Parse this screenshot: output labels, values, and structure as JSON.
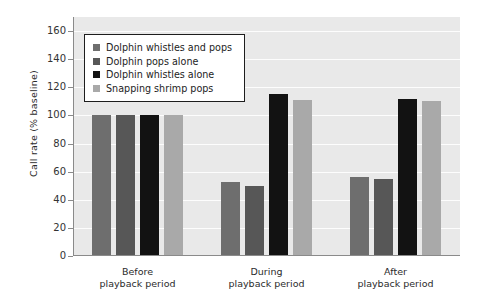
{
  "chart_data": {
    "type": "bar",
    "title": "",
    "xlabel": "",
    "ylabel": "Call rate (% baseline)",
    "ylim": [
      0,
      170
    ],
    "ytick_values": [
      0,
      20,
      40,
      60,
      80,
      100,
      120,
      140,
      160
    ],
    "ytick_labels": [
      "0",
      "20",
      "40",
      "60",
      "80",
      "100",
      "120",
      "140",
      "160"
    ],
    "grid": true,
    "legend_position": "upper-left-inside",
    "categories": [
      "Before\nplayback period",
      "During\nplayback period",
      "After\nplayback period"
    ],
    "category_lines": [
      [
        "Before",
        "playback period"
      ],
      [
        "During",
        "playback period"
      ],
      [
        "After",
        "playback period"
      ]
    ],
    "series": [
      {
        "name": "Dolphin whistles and pops",
        "color": "#6e6e6e",
        "values": [
          100,
          53,
          56
        ]
      },
      {
        "name": "Dolphin pops alone",
        "color": "#575757",
        "values": [
          100,
          50,
          55
        ]
      },
      {
        "name": "Dolphin whistles alone",
        "color": "#121212",
        "values": [
          100,
          115,
          112
        ]
      },
      {
        "name": "Snapping shrimp pops",
        "color": "#a9a9a9",
        "values": [
          100,
          111,
          110
        ]
      }
    ],
    "plot_background": "#e9e9e9",
    "gridline_color": "#fdfdfd",
    "axis_color": "#8a8a8a"
  },
  "legend": {
    "items": [
      {
        "label": "Dolphin whistles and pops",
        "swatch": "#6e6e6e"
      },
      {
        "label": "Dolphin pops alone",
        "swatch": "#575757"
      },
      {
        "label": "Dolphin whistles alone",
        "swatch": "#121212"
      },
      {
        "label": "Snapping shrimp pops",
        "swatch": "#a9a9a9"
      }
    ]
  }
}
